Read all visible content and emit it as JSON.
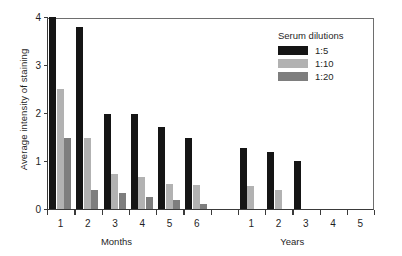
{
  "chart_data": {
    "type": "bar",
    "title": "",
    "subtitle": "",
    "xlabel": "",
    "ylabel": "Average intensity of staining",
    "ylim": [
      0,
      4
    ],
    "yticks": [
      0,
      1,
      2,
      3,
      4
    ],
    "ytick_labels": [
      "0",
      "1",
      "2",
      "3",
      "4"
    ],
    "grid": false,
    "legend_position": "top-right",
    "legend_title": "Serum dilutions",
    "categories": [
      "1",
      "2",
      "3",
      "4",
      "5",
      "6",
      "",
      "1",
      "2",
      "3",
      "4",
      "5"
    ],
    "category_groups": [
      {
        "label": "Months",
        "categories": [
          "1",
          "2",
          "3",
          "4",
          "5",
          "6"
        ]
      },
      {
        "label": "Years",
        "categories": [
          "1",
          "2",
          "3",
          "4",
          "5"
        ]
      }
    ],
    "series": [
      {
        "name": "1:5",
        "color": "#151515",
        "values": [
          4.0,
          3.8,
          1.97,
          1.97,
          1.7,
          1.48,
          null,
          1.27,
          1.18,
          1.0,
          0,
          0
        ]
      },
      {
        "name": "1:10",
        "color": "#b2b2b2",
        "values": [
          2.5,
          1.47,
          0.72,
          0.66,
          0.53,
          0.49,
          null,
          0.48,
          0.4,
          0,
          0,
          0
        ]
      },
      {
        "name": "1:20",
        "color": "#7e7e7e",
        "values": [
          1.47,
          0.4,
          0.33,
          0.24,
          0.18,
          0.1,
          null,
          0,
          0,
          0,
          0,
          0
        ]
      }
    ]
  },
  "legend": {
    "title": "Serum dilutions",
    "items": [
      {
        "label": "1:5",
        "color": "#151515"
      },
      {
        "label": "1:10",
        "color": "#b2b2b2"
      },
      {
        "label": "1:20",
        "color": "#7e7e7e"
      }
    ]
  },
  "axes": {
    "y_title": "Average intensity of staining",
    "y_tick_labels": [
      "0",
      "1",
      "2",
      "3",
      "4"
    ],
    "x_tick_labels": [
      "1",
      "2",
      "3",
      "4",
      "5",
      "6",
      "1",
      "2",
      "3",
      "4",
      "5"
    ],
    "x_group_labels": [
      "Months",
      "Years"
    ]
  },
  "colors": {
    "series_1_5": "#151515",
    "series_1_10": "#b2b2b2",
    "series_1_20": "#7e7e7e",
    "axis": "#3a3a3a",
    "background": "#ffffff"
  }
}
